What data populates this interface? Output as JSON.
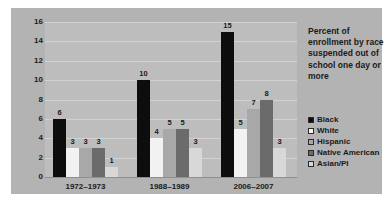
{
  "caption": {
    "text": "Percent of enrollment by race suspended out of school one day or more"
  },
  "legend": {
    "items": [
      {
        "label": "Black",
        "color": "#0d0d0d"
      },
      {
        "label": "White",
        "color": "#f2f2f2"
      },
      {
        "label": "Hispanic",
        "color": "#a8a8a8"
      },
      {
        "label": "Native American",
        "color": "#6b6b6b"
      },
      {
        "label": "Asian/PI",
        "color": "#d8d8d8"
      }
    ]
  },
  "chart_data": {
    "type": "bar",
    "title": "",
    "subtitle": "",
    "xlabel": "",
    "ylabel": "",
    "ylim": [
      0,
      16
    ],
    "yticks": [
      0,
      2,
      4,
      6,
      8,
      10,
      12,
      14,
      16
    ],
    "grid": true,
    "legend_position": "right",
    "categories": [
      "1972–1973",
      "1988–1989",
      "2006–2007"
    ],
    "series": [
      {
        "name": "Black",
        "color": "#0d0d0d",
        "values": [
          6,
          10,
          15
        ]
      },
      {
        "name": "White",
        "color": "#f2f2f2",
        "values": [
          3,
          4,
          5
        ]
      },
      {
        "name": "Hispanic",
        "color": "#a8a8a8",
        "values": [
          3,
          5,
          7
        ]
      },
      {
        "name": "Native American",
        "color": "#6b6b6b",
        "values": [
          3,
          5,
          8
        ]
      },
      {
        "name": "Asian/PI",
        "color": "#d8d8d8",
        "values": [
          1,
          3,
          3
        ]
      }
    ],
    "annotation": "Percent of enrollment by race suspended out of school one day or more"
  },
  "colors": {
    "panel": "#b3b3b3",
    "plot": "#bdbdbd",
    "gridline": "#d2d2d2",
    "text": "#1a1a1a"
  }
}
